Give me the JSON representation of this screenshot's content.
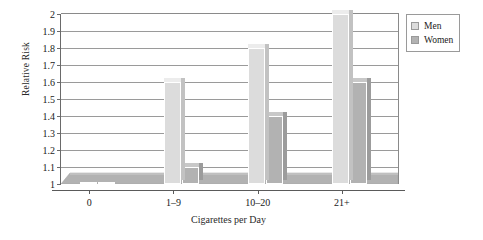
{
  "chart_data": {
    "type": "bar",
    "title": "",
    "xlabel": "Cigarettes per Day",
    "ylabel": "Relative Risk",
    "categories": [
      "0",
      "1–9",
      "10–20",
      "21+"
    ],
    "series": [
      {
        "name": "Men",
        "values": [
          1.0,
          1.6,
          1.8,
          2.0
        ],
        "color": "#dcdcdc"
      },
      {
        "name": "Women",
        "values": [
          1.0,
          1.1,
          1.4,
          1.6
        ],
        "color": "#b2b2b2"
      }
    ],
    "ylim": [
      1,
      2
    ],
    "yticks": [
      "1",
      "1.1",
      "1.2",
      "1.3",
      "1.4",
      "1.5",
      "1.6",
      "1.7",
      "1.8",
      "1.9",
      "2"
    ],
    "ytick_values": [
      1,
      1.1,
      1.2,
      1.3,
      1.4,
      1.5,
      1.6,
      1.7,
      1.8,
      1.9,
      2
    ],
    "grid": true,
    "legend_position": "right",
    "style": "3d-grouped-bar"
  },
  "legend": {
    "entries": [
      {
        "label": "Men",
        "swatch": "#dcdcdc"
      },
      {
        "label": "Women",
        "swatch": "#b2b2b2"
      }
    ]
  }
}
